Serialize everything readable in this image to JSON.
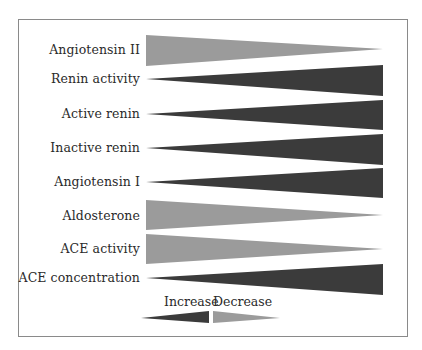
{
  "diagram": {
    "type": "wedge-trend-diagram",
    "colors": {
      "increase": "#3b3b3b",
      "decrease": "#9b9b9b",
      "frame": "#8a8a8a",
      "text": "#2a2a2a"
    },
    "rows": [
      {
        "label": "Angiotensin II",
        "trend": "decrease"
      },
      {
        "label": "Renin activity",
        "trend": "increase"
      },
      {
        "label": "Active renin",
        "trend": "increase"
      },
      {
        "label": "Inactive renin",
        "trend": "increase"
      },
      {
        "label": "Angiotensin I",
        "trend": "increase"
      },
      {
        "label": "Aldosterone",
        "trend": "decrease"
      },
      {
        "label": "ACE activity",
        "trend": "decrease"
      },
      {
        "label": "ACE concentration",
        "trend": "increase"
      }
    ],
    "legend": {
      "increase_label": "Increase",
      "decrease_label": "Decrease"
    }
  }
}
